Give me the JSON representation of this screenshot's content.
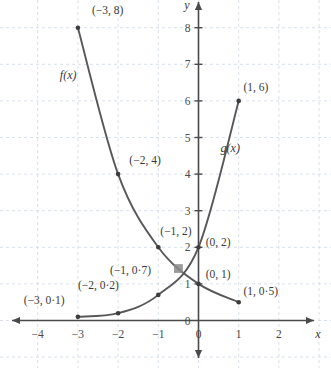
{
  "chart_data": {
    "type": "line",
    "title": "",
    "xlabel": "x",
    "ylabel": "y",
    "grid": true,
    "legend": "inline-curve-labels",
    "xlim": [
      -4.7,
      2.55
    ],
    "ylim": [
      -0.8,
      8.7
    ],
    "xticks": [
      "-4",
      "-3",
      "-2",
      "-1",
      "0",
      "1",
      "2"
    ],
    "xtick_values": [
      -4,
      -3,
      -2,
      -1,
      0,
      1,
      2
    ],
    "yticks": [
      "0",
      "1",
      "2",
      "3",
      "4",
      "5",
      "6",
      "7",
      "8"
    ],
    "ytick_values": [
      0,
      1,
      2,
      3,
      4,
      5,
      6,
      7,
      8
    ],
    "series": [
      {
        "name": "f(x)",
        "label": "f(x)",
        "label_x": -3.45,
        "label_y": 6.6,
        "color": "#58585a",
        "points": [
          {
            "x": -3,
            "y": 8,
            "label": "(−3, 8)",
            "lx": -2.65,
            "ly": 8.45
          },
          {
            "x": -2,
            "y": 4,
            "label": "(−2, 4)",
            "lx": -1.72,
            "ly": 4.35
          },
          {
            "x": -1,
            "y": 2,
            "label": "(−1, 2)",
            "lx": -0.95,
            "ly": 2.42
          },
          {
            "x": 0,
            "y": 1,
            "label": "(0, 1)",
            "lx": 0.18,
            "ly": 1.22
          },
          {
            "x": 1,
            "y": 0.5,
            "label": "(1, 0·5)",
            "lx": 1.12,
            "ly": 0.78
          }
        ]
      },
      {
        "name": "g(x)",
        "label": "g(x)",
        "label_x": 0.55,
        "label_y": 4.6,
        "color": "#58585a",
        "points": [
          {
            "x": -3,
            "y": 0.1,
            "label": "(−3, 0·1)",
            "lx": -4.35,
            "ly": 0.52
          },
          {
            "x": -2,
            "y": 0.2,
            "label": "(−2, 0·2)",
            "lx": -3.0,
            "ly": 0.92
          },
          {
            "x": -1,
            "y": 0.7,
            "label": "(−1, 0·7)",
            "lx": -2.2,
            "ly": 1.35
          },
          {
            "x": 0,
            "y": 2,
            "label": "(0, 2)",
            "lx": 0.18,
            "ly": 2.1
          },
          {
            "x": 1,
            "y": 6,
            "label": "(1, 6)",
            "lx": 1.12,
            "ly": 6.35
          }
        ]
      }
    ],
    "intersection": {
      "x": -0.5,
      "y": 1.42,
      "marker": "square",
      "color": "#8a8a8a"
    },
    "annotations": []
  },
  "style": {
    "background": "#ffffff",
    "grid_color": "#c9d4e2",
    "axis_color": "#4a4a4a",
    "curve_color": "#58585a",
    "point_color": "#3d3d3d",
    "text_color": "#3a3a3a"
  }
}
